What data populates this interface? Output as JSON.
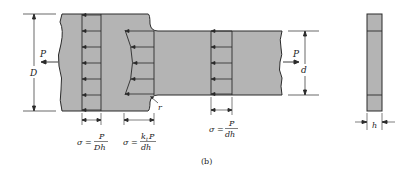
{
  "figure_label": "(b)",
  "colors": {
    "fill": "#b4b4b4",
    "stroke": "#2a2a2a",
    "background": "#ffffff"
  },
  "labels": {
    "load_left": "P",
    "load_right": "P",
    "width_wide": "D",
    "width_narrow": "d",
    "fillet_radius": "r",
    "thickness": "h"
  },
  "stress_formulas": [
    {
      "lhs": "σ =",
      "num": "P",
      "den": "Dh"
    },
    {
      "lhs": "σ =",
      "num": "k",
      "num_sub": "t",
      "num_tail": "P",
      "den": "dh"
    },
    {
      "lhs": "σ =",
      "num": "P",
      "den": "dh"
    }
  ]
}
